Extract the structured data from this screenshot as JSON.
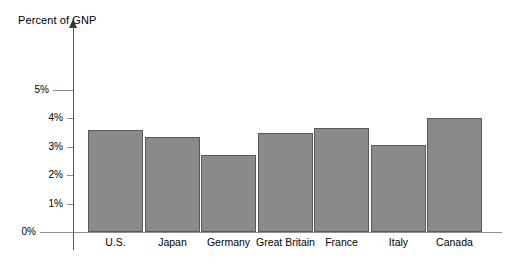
{
  "chart_data": {
    "type": "bar",
    "title": "Percent of GNP",
    "xlabel": "",
    "ylabel": "Percent of GNP",
    "categories": [
      "U.S.",
      "Japan",
      "Germany",
      "Great Britain",
      "France",
      "Italy",
      "Canada"
    ],
    "values": [
      3.6,
      3.35,
      2.7,
      3.5,
      3.65,
      3.05,
      4.0
    ],
    "ytick_labels": [
      "5%",
      "4%",
      "3%",
      "2%",
      "1%",
      "0%"
    ],
    "ytick_values": [
      5,
      4,
      3,
      2,
      1,
      0
    ],
    "ylim": [
      0,
      5.6
    ],
    "grid": false,
    "legend": null,
    "bar_color": "#8a8a8a",
    "bar_edge_color": "#595959",
    "axis_color": "#8d8d8d"
  },
  "axis": {
    "title": "Percent of GNP"
  }
}
